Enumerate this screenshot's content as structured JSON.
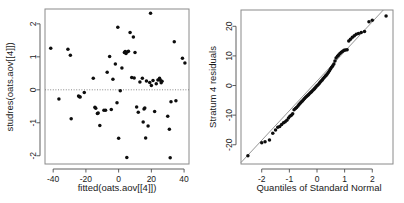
{
  "figure": {
    "width": 404,
    "height": 203,
    "background": "#ffffff",
    "point_color": "#0d0d0d",
    "axis_color": "#4d4d4d",
    "box_color": "#8a8a8a",
    "panels": 2
  },
  "chart_data": [
    {
      "type": "scatter",
      "name": "residuals-vs-fitted",
      "title": "",
      "xlabel": "fitted(oats.aov[[4]])",
      "ylabel": "studres(oats.aov[[4]])",
      "xlim": [
        -45,
        43
      ],
      "ylim": [
        -2.25,
        2.45
      ],
      "xticks": [
        -40,
        -20,
        0,
        20,
        40
      ],
      "xticklabels": [
        "-40",
        "-20",
        "0",
        "20",
        "40"
      ],
      "yticks": [
        -2,
        -1,
        0,
        1,
        2
      ],
      "yticklabels": [
        "-2",
        "-1",
        "0",
        "1",
        "2"
      ],
      "grid": false,
      "legend": null,
      "annotations": [
        {
          "kind": "hline",
          "y": 0,
          "style": "dotted"
        }
      ],
      "x": [
        -41.5,
        -36.5,
        -31.0,
        -29.5,
        -29.0,
        -24.5,
        -24.0,
        -23.5,
        -21.0,
        -15.5,
        -14.5,
        -14.0,
        -13.0,
        -12.5,
        -11.5,
        -9.0,
        -8.0,
        -7.0,
        -5.5,
        -4.5,
        -3.5,
        -2.0,
        -1.0,
        -0.5,
        0.0,
        1.0,
        2.0,
        3.5,
        4.0,
        4.5,
        5.0,
        5.5,
        6.0,
        7.0,
        8.0,
        9.0,
        9.5,
        10.0,
        11.0,
        12.0,
        13.0,
        14.5,
        15.0,
        15.5,
        16.0,
        16.5,
        17.0,
        18.0,
        19.0,
        19.5,
        20.0,
        21.0,
        22.0,
        23.0,
        24.0,
        25.0,
        25.5,
        26.0,
        26.5,
        30.0,
        31.0,
        31.5,
        32.0,
        34.0,
        35.0,
        39.0,
        40.5
      ],
      "y": [
        1.26,
        -0.28,
        1.23,
        1.05,
        -0.88,
        -0.19,
        -0.21,
        -0.22,
        -0.08,
        0.35,
        -0.53,
        -0.56,
        -0.72,
        -0.7,
        -1.08,
        -0.62,
        -0.62,
        0.53,
        1.01,
        -0.6,
        0.32,
        0.78,
        -0.39,
        1.9,
        -1.47,
        -0.03,
        0.66,
        1.13,
        1.16,
        1.1,
        -2.05,
        1.15,
        1.17,
        1.74,
        0.37,
        1.6,
        0.36,
        1.13,
        -0.52,
        -0.68,
        0.24,
        0.35,
        -0.98,
        -0.58,
        -0.55,
        -1.46,
        0.27,
        -1.1,
        0.22,
        2.32,
        0.13,
        0.28,
        -0.66,
        0.18,
        0.3,
        0.35,
        0.29,
        0.21,
        0.26,
        -0.8,
        -1.2,
        -2.06,
        -0.36,
        1.46,
        -0.33,
        0.96,
        0.81
      ]
    },
    {
      "type": "scatter",
      "name": "normal-qq-stratum-4",
      "title": "",
      "xlabel": "Quantiles of Standard Normal",
      "ylabel": "Stratum 4 residuals",
      "xlim": [
        -2.75,
        2.75
      ],
      "ylim": [
        -26.5,
        25.5
      ],
      "xticks": [
        -2,
        -1,
        0,
        1,
        2
      ],
      "xticklabels": [
        "-2",
        "-1",
        "0",
        "1",
        "2"
      ],
      "yticks": [
        -20,
        -10,
        0,
        10,
        20
      ],
      "yticklabels": [
        "-20",
        "-10",
        "0",
        "10",
        "20"
      ],
      "grid": false,
      "legend": null,
      "annotations": [
        {
          "kind": "qqline",
          "x0": -2.1,
          "y0": -19.5,
          "x1": 2.1,
          "y1": 22.5,
          "style": "solid"
        }
      ],
      "x": [
        -2.5,
        -2.0,
        -1.88,
        -1.72,
        -1.6,
        -1.5,
        -1.42,
        -1.35,
        -1.28,
        -1.21,
        -1.15,
        -1.09,
        -1.03,
        -0.98,
        -0.93,
        -0.88,
        -0.83,
        -0.78,
        -0.74,
        -0.69,
        -0.65,
        -0.61,
        -0.57,
        -0.53,
        -0.49,
        -0.45,
        -0.41,
        -0.37,
        -0.33,
        -0.3,
        -0.26,
        -0.22,
        -0.19,
        -0.15,
        -0.11,
        -0.08,
        -0.04,
        0.0,
        0.04,
        0.08,
        0.11,
        0.15,
        0.19,
        0.22,
        0.26,
        0.3,
        0.33,
        0.37,
        0.41,
        0.45,
        0.49,
        0.53,
        0.57,
        0.61,
        0.65,
        0.69,
        0.74,
        0.78,
        0.83,
        0.88,
        0.93,
        0.98,
        1.03,
        1.09,
        1.15,
        1.21,
        1.28,
        1.35,
        1.42,
        1.5,
        1.6,
        1.72,
        1.88,
        2.0,
        2.5
      ],
      "y": [
        -23.7,
        -19.3,
        -19.0,
        -18.4,
        -16.1,
        -15.0,
        -14.1,
        -13.8,
        -13.2,
        -12.6,
        -12.2,
        -11.7,
        -11.0,
        -10.4,
        -10.0,
        -9.5,
        -8.2,
        -7.8,
        -7.4,
        -6.9,
        -6.4,
        -6.0,
        -5.6,
        -5.2,
        -4.8,
        -4.4,
        -4.0,
        -3.6,
        -3.3,
        -3.0,
        -2.6,
        -2.3,
        -2.0,
        -1.6,
        -1.3,
        -0.9,
        -0.5,
        -0.1,
        0.3,
        0.7,
        1.1,
        1.5,
        1.9,
        2.3,
        2.7,
        3.1,
        3.5,
        3.9,
        4.4,
        5.0,
        5.6,
        6.2,
        6.7,
        7.3,
        8.3,
        9.3,
        9.9,
        10.3,
        10.8,
        11.2,
        11.6,
        11.9,
        12.0,
        12.1,
        15.0,
        15.6,
        16.3,
        16.8,
        17.3,
        17.6,
        17.9,
        18.2,
        21.5,
        22.0,
        23.5
      ]
    }
  ]
}
